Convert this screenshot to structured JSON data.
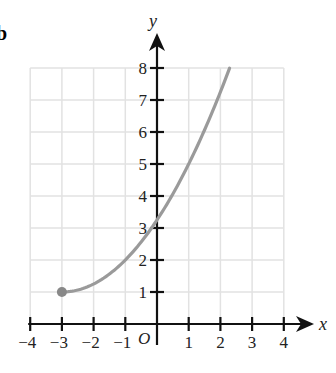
{
  "part_label": "b",
  "chart_data": {
    "type": "line",
    "title": "",
    "xlabel": "x",
    "ylabel": "y",
    "origin_label": "O",
    "xlim": [
      -4,
      4
    ],
    "ylim": [
      0,
      8
    ],
    "x_ticks": [
      -4,
      -3,
      -2,
      -1,
      1,
      2,
      3,
      4
    ],
    "x_tick_labels": [
      "−4",
      "−3",
      "−2",
      "−1",
      "1",
      "2",
      "3",
      "4"
    ],
    "y_ticks": [
      1,
      2,
      3,
      4,
      5,
      6,
      7,
      8
    ],
    "y_tick_labels": [
      "1",
      "2",
      "3",
      "4",
      "5",
      "6",
      "7",
      "8"
    ],
    "grid": true,
    "series": [
      {
        "name": "curve",
        "description": "half-parabola starting at closed point (-3, 1), increasing to the right",
        "start_point": {
          "x": -3,
          "y": 1,
          "closed": true
        },
        "x": [
          -3,
          -2,
          -1,
          0,
          1,
          2,
          2.29
        ],
        "values": [
          1,
          1.25,
          2,
          3.25,
          5,
          7.25,
          8
        ]
      }
    ],
    "colors": {
      "axis": "#111111",
      "grid": "#e2e2e2",
      "curve": "#9a9a9a",
      "point": "#888888"
    }
  }
}
